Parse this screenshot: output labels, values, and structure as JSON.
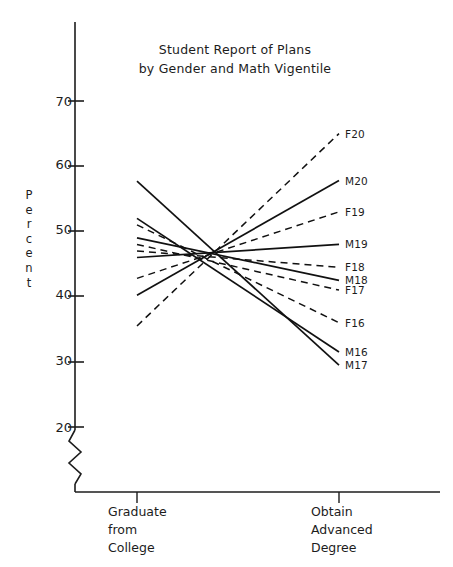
{
  "chart_data": {
    "type": "line",
    "title": "Student Report of Plans by Gender and Math Vigentile",
    "title_lines": [
      "Student Report of Plans",
      "by Gender and Math Vigentile"
    ],
    "xlabel": "",
    "ylabel": "Percent",
    "categories": [
      "Graduate from College",
      "Obtain Advanced Degree"
    ],
    "category_lines": [
      [
        "Graduate",
        "from",
        "College"
      ],
      [
        "Obtain",
        "Advanced",
        "Degree"
      ]
    ],
    "ylim": [
      20,
      70
    ],
    "yticks": [
      20,
      30,
      40,
      50,
      60,
      70
    ],
    "ytick_labels": [
      "20",
      "30",
      "40",
      "50",
      "60",
      "70"
    ],
    "axis_break": true,
    "axis_break_note": "zigzag break below 20",
    "grid": false,
    "legend": "inline-right-labels",
    "series": [
      {
        "name": "F20",
        "label": "F20",
        "style": "dashed",
        "values": [
          35.5,
          65.0
        ]
      },
      {
        "name": "M20",
        "label": "M20",
        "style": "solid",
        "values": [
          40.2,
          57.8
        ]
      },
      {
        "name": "F19",
        "label": "F19",
        "style": "dashed",
        "values": [
          42.8,
          53.0
        ]
      },
      {
        "name": "M19",
        "label": "M19",
        "style": "solid",
        "values": [
          46.0,
          48.0
        ]
      },
      {
        "name": "F18",
        "label": "F18",
        "style": "dashed",
        "values": [
          47.0,
          44.5
        ]
      },
      {
        "name": "M18",
        "label": "M18",
        "style": "solid",
        "values": [
          49.0,
          42.5
        ]
      },
      {
        "name": "F17",
        "label": "F17",
        "style": "dashed",
        "values": [
          48.0,
          41.0
        ]
      },
      {
        "name": "F16",
        "label": "F16",
        "style": "dashed",
        "values": [
          51.0,
          36.0
        ]
      },
      {
        "name": "M16",
        "label": "M16",
        "style": "solid",
        "values": [
          52.0,
          31.5
        ]
      },
      {
        "name": "M17",
        "label": "M17",
        "style": "solid",
        "values": [
          57.7,
          29.5
        ]
      }
    ]
  },
  "colors": {
    "ink": "#1c1c1c",
    "line": "#111111",
    "background": "#ffffff"
  }
}
